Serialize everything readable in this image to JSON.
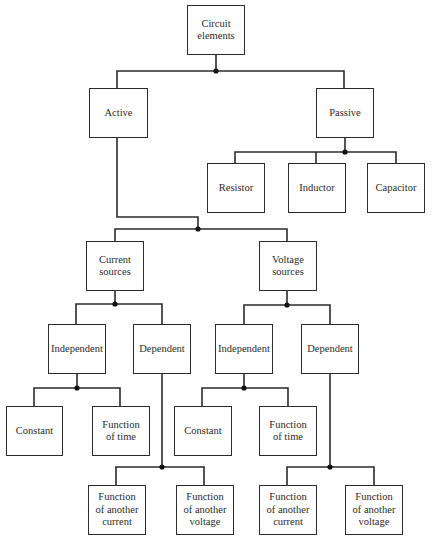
{
  "colors": {
    "line": "#2b2b2b",
    "background": "#ffffff"
  },
  "nodes": {
    "root": "Circuit\nelements",
    "active": "Active",
    "passive": "Passive",
    "resistor": "Resistor",
    "inductor": "Inductor",
    "capacitor": "Capacitor",
    "current_sources": "Current\nsources",
    "voltage_sources": "Voltage\nsources",
    "cs_independent": "Independent",
    "cs_dependent": "Dependent",
    "vs_independent": "Independent",
    "vs_dependent": "Dependent",
    "cs_ind_constant": "Constant",
    "cs_ind_function_of_time": "Function\nof time",
    "cs_dep_function_current": "Function\nof another\ncurrent",
    "cs_dep_function_voltage": "Function\nof another\nvoltage",
    "vs_ind_constant": "Constant",
    "vs_ind_function_of_time": "Function\nof time",
    "vs_dep_function_current": "Function\nof another\ncurrent",
    "vs_dep_function_voltage": "Function\nof another\nvoltage"
  }
}
